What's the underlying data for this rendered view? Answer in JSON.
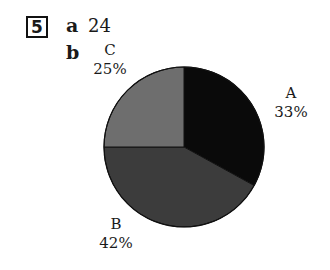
{
  "question": {
    "number": "5"
  },
  "parts": [
    {
      "letter": "a",
      "answer": "24"
    },
    {
      "letter": "b",
      "answer": ""
    }
  ],
  "chart_data": {
    "type": "pie",
    "title": "",
    "categories": [
      "A",
      "B",
      "C"
    ],
    "values": [
      33,
      42,
      25
    ],
    "labels": [
      "33%",
      "42%",
      "25%"
    ],
    "colors": [
      "#0a0a0a",
      "#3c3c3c",
      "#6e6e6e"
    ],
    "start_angle": "12 o'clock, clockwise"
  },
  "labels": {
    "A": {
      "name": "A",
      "pct": "33%"
    },
    "B": {
      "name": "B",
      "pct": "42%"
    },
    "C": {
      "name": "C",
      "pct": "25%"
    }
  }
}
